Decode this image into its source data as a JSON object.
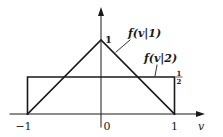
{
  "chart_data": {
    "type": "line",
    "title": "",
    "xlabel": "v",
    "ylabel": "",
    "xlim": [
      -1.35,
      1.45
    ],
    "ylim": [
      0,
      1.55
    ],
    "grid": false,
    "x_ticks": [
      {
        "value": -1,
        "label": "−1"
      },
      {
        "value": 0,
        "label": "0"
      },
      {
        "value": 1,
        "label": "1"
      }
    ],
    "y_ticks": [
      {
        "value": 1,
        "label": "1"
      },
      {
        "value": 0.5,
        "label_num": "1",
        "label_den": "2"
      }
    ],
    "series": [
      {
        "name": "f(v|1)",
        "shape": "triangle",
        "x": [
          -1,
          0,
          1
        ],
        "y": [
          0,
          1,
          0
        ]
      },
      {
        "name": "f(v|2)",
        "shape": "rectangle",
        "x": [
          -1,
          -1,
          1,
          1
        ],
        "y": [
          0,
          0.5,
          0.5,
          0
        ]
      }
    ],
    "annotations": [
      {
        "text": "f(v|1)",
        "points_to_series": "f(v|1)",
        "at_x": 0.45
      },
      {
        "text": "f(v|2)",
        "points_to_series": "f(v|2)",
        "at_x": 0.75
      }
    ]
  }
}
